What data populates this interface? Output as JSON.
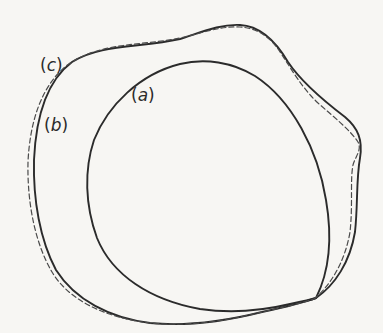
{
  "figure": {
    "type": "shape-outline-comparison",
    "background": "#f7f6f3",
    "stroke_color": "#2b2b2b",
    "curves": [
      {
        "id": "a",
        "label": "(a)",
        "letter": "a",
        "style": "solid",
        "description": "inner roughly circular outline"
      },
      {
        "id": "b",
        "label": "(b)",
        "letter": "b",
        "style": "solid",
        "description": "outer irregular outline"
      },
      {
        "id": "c",
        "label": "(c)",
        "letter": "c",
        "style": "dashed",
        "description": "dashed outline closely following (b)"
      }
    ],
    "labels": {
      "a": {
        "open": "(",
        "letter": "a",
        "close": ")"
      },
      "b": {
        "open": "(",
        "letter": "b",
        "close": ")"
      },
      "c": {
        "open": "(",
        "letter": "c",
        "close": ")"
      }
    }
  }
}
